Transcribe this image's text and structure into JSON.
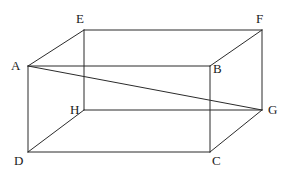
{
  "figure": {
    "name": "rectangular-cuboid-with-space-diagonal",
    "kind": "geometry-diagram",
    "background_color": "#ffffff",
    "stroke_color": "#2b2b2b",
    "stroke_width": 1,
    "label_color": "#1a1a1a",
    "width": 285,
    "height": 175
  },
  "vertices": [
    {
      "id": "A",
      "label": "A",
      "x": 28,
      "y": 66,
      "label_x": 11,
      "label_y": 59,
      "face": "front-top-left"
    },
    {
      "id": "B",
      "label": "B",
      "x": 210,
      "y": 66,
      "label_x": 213,
      "label_y": 62,
      "face": "front-top-right"
    },
    {
      "id": "C",
      "label": "C",
      "x": 210,
      "y": 152,
      "label_x": 212,
      "label_y": 154,
      "face": "front-bottom-right"
    },
    {
      "id": "D",
      "label": "D",
      "x": 28,
      "y": 152,
      "label_x": 14,
      "label_y": 154,
      "face": "front-bottom-left"
    },
    {
      "id": "E",
      "label": "E",
      "x": 84,
      "y": 30,
      "label_x": 76,
      "label_y": 12,
      "face": "back-top-left"
    },
    {
      "id": "F",
      "label": "F",
      "x": 262,
      "y": 30,
      "label_x": 256,
      "label_y": 12,
      "face": "back-top-right"
    },
    {
      "id": "G",
      "label": "G",
      "x": 262,
      "y": 110,
      "label_x": 268,
      "label_y": 103,
      "face": "back-bottom-right"
    },
    {
      "id": "H",
      "label": "H",
      "x": 84,
      "y": 110,
      "label_x": 70,
      "label_y": 103,
      "face": "back-bottom-left"
    }
  ],
  "edges": [
    {
      "id": "AB",
      "from": "A",
      "to": "B",
      "name": "edge-a-b",
      "style": "solid"
    },
    {
      "id": "BC",
      "from": "B",
      "to": "C",
      "name": "edge-b-c",
      "style": "solid"
    },
    {
      "id": "CD",
      "from": "C",
      "to": "D",
      "name": "edge-c-d",
      "style": "solid"
    },
    {
      "id": "DA",
      "from": "D",
      "to": "A",
      "name": "edge-d-a",
      "style": "solid"
    },
    {
      "id": "EF",
      "from": "E",
      "to": "F",
      "name": "edge-e-f",
      "style": "solid"
    },
    {
      "id": "FG",
      "from": "F",
      "to": "G",
      "name": "edge-f-g",
      "style": "solid"
    },
    {
      "id": "GH",
      "from": "G",
      "to": "H",
      "name": "edge-g-h",
      "style": "solid"
    },
    {
      "id": "HE",
      "from": "H",
      "to": "E",
      "name": "edge-h-e",
      "style": "solid"
    },
    {
      "id": "AE",
      "from": "A",
      "to": "E",
      "name": "edge-a-e",
      "style": "solid"
    },
    {
      "id": "BF",
      "from": "B",
      "to": "F",
      "name": "edge-b-f",
      "style": "solid"
    },
    {
      "id": "CG",
      "from": "C",
      "to": "G",
      "name": "edge-c-g",
      "style": "solid"
    },
    {
      "id": "DH",
      "from": "D",
      "to": "H",
      "name": "edge-d-h",
      "style": "solid"
    }
  ],
  "diagonals": [
    {
      "id": "AG",
      "from": "A",
      "to": "G",
      "name": "space-diagonal-a-g",
      "style": "solid"
    }
  ]
}
